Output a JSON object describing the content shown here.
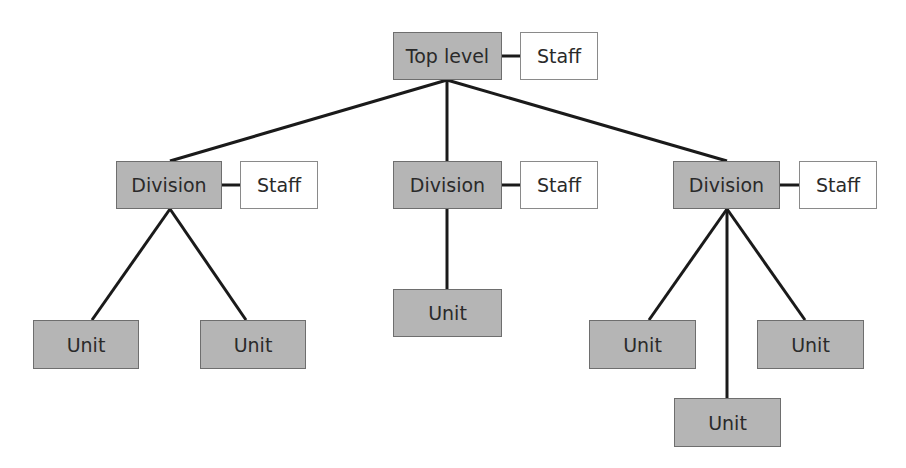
{
  "diagram": {
    "type": "org-chart",
    "colors": {
      "node_fill": "#b5b5b5",
      "staff_fill": "#ffffff",
      "line": "#1a1a1a",
      "text": "#2a2a2a"
    },
    "nodes": [
      {
        "id": "top",
        "label": "Top level",
        "kind": "gray",
        "x": 393,
        "y": 32,
        "w": 109,
        "h": 48
      },
      {
        "id": "top_staff",
        "label": "Staff",
        "kind": "white",
        "x": 520,
        "y": 32,
        "w": 78,
        "h": 48
      },
      {
        "id": "div1",
        "label": "Division",
        "kind": "gray",
        "x": 116,
        "y": 161,
        "w": 106,
        "h": 48
      },
      {
        "id": "div1_staff",
        "label": "Staff",
        "kind": "white",
        "x": 240,
        "y": 161,
        "w": 78,
        "h": 48
      },
      {
        "id": "div2",
        "label": "Division",
        "kind": "gray",
        "x": 393,
        "y": 161,
        "w": 109,
        "h": 48
      },
      {
        "id": "div2_staff",
        "label": "Staff",
        "kind": "white",
        "x": 520,
        "y": 161,
        "w": 78,
        "h": 48
      },
      {
        "id": "div3",
        "label": "Division",
        "kind": "gray",
        "x": 673,
        "y": 161,
        "w": 107,
        "h": 48
      },
      {
        "id": "div3_staff",
        "label": "Staff",
        "kind": "white",
        "x": 799,
        "y": 161,
        "w": 78,
        "h": 48
      },
      {
        "id": "unit1",
        "label": "Unit",
        "kind": "gray",
        "x": 33,
        "y": 320,
        "w": 106,
        "h": 49
      },
      {
        "id": "unit2",
        "label": "Unit",
        "kind": "gray",
        "x": 200,
        "y": 320,
        "w": 106,
        "h": 49
      },
      {
        "id": "unit3",
        "label": "Unit",
        "kind": "gray",
        "x": 393,
        "y": 289,
        "w": 109,
        "h": 48
      },
      {
        "id": "unit4",
        "label": "Unit",
        "kind": "gray",
        "x": 589,
        "y": 320,
        "w": 107,
        "h": 49
      },
      {
        "id": "unit5",
        "label": "Unit",
        "kind": "gray",
        "x": 757,
        "y": 320,
        "w": 107,
        "h": 49
      },
      {
        "id": "unit6",
        "label": "Unit",
        "kind": "gray",
        "x": 674,
        "y": 398,
        "w": 107,
        "h": 49
      }
    ],
    "edges": [
      {
        "from": "top",
        "to": "top_staff",
        "x1": 502,
        "y1": 56,
        "x2": 520,
        "y2": 56
      },
      {
        "from": "top",
        "to": "div1",
        "x1": 447,
        "y1": 80,
        "x2": 170,
        "y2": 161
      },
      {
        "from": "top",
        "to": "div2",
        "x1": 447,
        "y1": 80,
        "x2": 447,
        "y2": 161
      },
      {
        "from": "top",
        "to": "div3",
        "x1": 447,
        "y1": 80,
        "x2": 727,
        "y2": 161
      },
      {
        "from": "div1",
        "to": "div1_staff",
        "x1": 222,
        "y1": 185,
        "x2": 240,
        "y2": 185
      },
      {
        "from": "div2",
        "to": "div2_staff",
        "x1": 502,
        "y1": 185,
        "x2": 520,
        "y2": 185
      },
      {
        "from": "div3",
        "to": "div3_staff",
        "x1": 780,
        "y1": 185,
        "x2": 799,
        "y2": 185
      },
      {
        "from": "div1",
        "to": "unit1",
        "x1": 170,
        "y1": 209,
        "x2": 92,
        "y2": 320
      },
      {
        "from": "div1",
        "to": "unit2",
        "x1": 170,
        "y1": 209,
        "x2": 246,
        "y2": 320
      },
      {
        "from": "div2",
        "to": "unit3",
        "x1": 447,
        "y1": 209,
        "x2": 447,
        "y2": 289
      },
      {
        "from": "div3",
        "to": "unit4",
        "x1": 727,
        "y1": 209,
        "x2": 649,
        "y2": 320
      },
      {
        "from": "div3",
        "to": "unit5",
        "x1": 727,
        "y1": 209,
        "x2": 805,
        "y2": 320
      },
      {
        "from": "div3",
        "to": "unit6",
        "x1": 727,
        "y1": 209,
        "x2": 727,
        "y2": 398
      }
    ]
  }
}
